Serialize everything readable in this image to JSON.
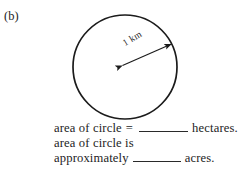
{
  "figure": {
    "part_label": "(b)",
    "background_color": "#ffffff",
    "ink_color": "#1d1d1d"
  },
  "diagram": {
    "shape_name": "circle",
    "circle": {
      "center_x": 125,
      "center_y": 67,
      "radius": 52,
      "stroke_color": "#1b1b1b",
      "stroke_width": 1.6,
      "fill": "none"
    },
    "radius_arrow": {
      "label": "1 km",
      "from_x": 122,
      "from_y": 66,
      "to_x": 172,
      "to_y": 44,
      "double_headed": true,
      "stroke_color": "#1b1b1b",
      "rotation_deg": -31
    }
  },
  "answers": {
    "line1": {
      "prefix": "area of circle",
      "equals": "=",
      "blank": "",
      "suffix": "hectares."
    },
    "line2": {
      "text": "area of circle is"
    },
    "line3": {
      "prefix": "approximately",
      "blank": "",
      "suffix": "acres."
    }
  }
}
